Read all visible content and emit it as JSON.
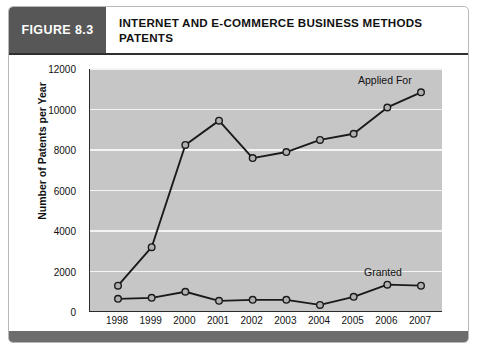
{
  "figure": {
    "tag": "FIGURE 8.3",
    "title": "INTERNET AND E-COMMERCE BUSINESS METHODS PATENTS"
  },
  "chart_data": {
    "type": "line",
    "title": "INTERNET AND E-COMMERCE BUSINESS METHODS PATENTS",
    "xlabel": "Year",
    "ylabel": "Number of Patents per Year",
    "categories": [
      "1998",
      "1999",
      "2000",
      "2001",
      "2002",
      "2003",
      "2004",
      "2005",
      "2006",
      "2007"
    ],
    "ylim": [
      0,
      12000
    ],
    "ytick_values": [
      0,
      2000,
      4000,
      6000,
      8000,
      10000,
      12000
    ],
    "ytick_labels": [
      "0",
      "2000",
      "4000",
      "6000",
      "8000",
      "10000",
      "12000"
    ],
    "grid": true,
    "legend_position": "inline-right",
    "series": [
      {
        "name": "Applied For",
        "values": [
          1300,
          3200,
          8250,
          9450,
          7600,
          7900,
          8500,
          8800,
          10100,
          10850
        ],
        "color": "#1a1a1a",
        "marker_fill": "#b0b0b0"
      },
      {
        "name": "Granted",
        "values": [
          650,
          700,
          1000,
          550,
          600,
          600,
          350,
          750,
          1350,
          1300
        ],
        "color": "#1a1a1a",
        "marker_fill": "#b0b0b0"
      }
    ],
    "annotations": [
      {
        "text": "Applied For",
        "series": "Applied For"
      },
      {
        "text": "Granted",
        "series": "Granted"
      }
    ]
  },
  "colors": {
    "tag_background": "#575757",
    "plot_background": "#c6c6c6",
    "gridline": "#f4f4f4",
    "line": "#1a1a1a",
    "marker_fill": "#b0b0b0",
    "footer_bar": "#6d6d6d"
  }
}
